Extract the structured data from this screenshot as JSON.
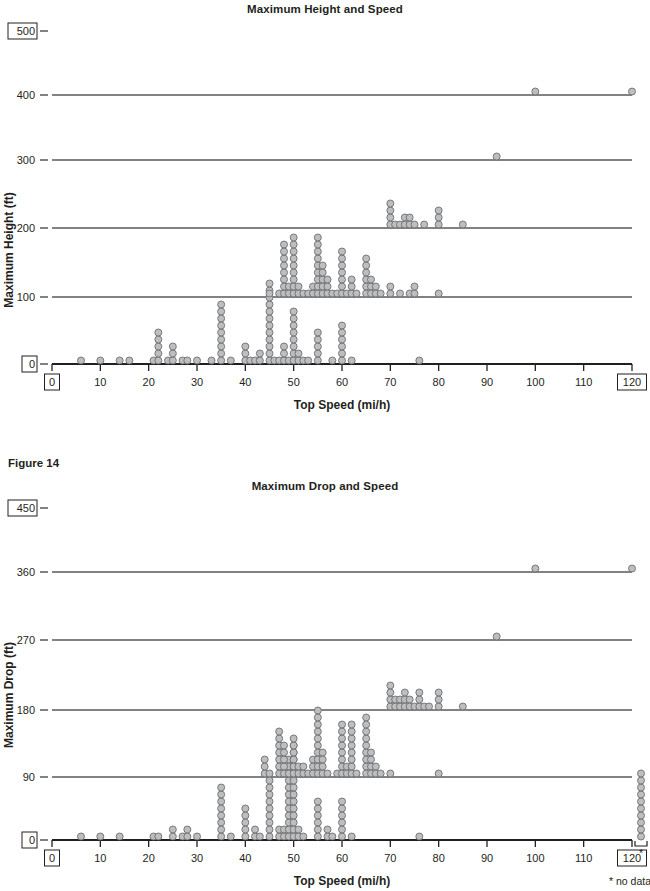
{
  "page": {
    "width": 650,
    "height": 891,
    "background": "#ffffff",
    "ink": "#231f20"
  },
  "figure_caption": "Figure 14",
  "notes": {
    "no_data": "* no data",
    "asterisk": "*"
  },
  "colors": {
    "dot_fill": "#bcbec0",
    "dot_stroke": "#6d6e71",
    "axis": "#58585b",
    "baseline": "#231f20"
  },
  "chart_data": [
    {
      "id": "max-height-and-speed",
      "type": "scatter",
      "title": "Maximum Height and Speed",
      "xlabel": "Top Speed (mi/h)",
      "ylabel": "Maximum Height (ft)",
      "xlim": [
        0,
        120
      ],
      "ylim": [
        0,
        500
      ],
      "xticks": [
        0,
        10,
        20,
        30,
        40,
        50,
        60,
        70,
        80,
        90,
        100,
        110,
        120
      ],
      "xticks_boxed": [
        0,
        120
      ],
      "yticks": [
        0,
        100,
        200,
        300,
        400,
        500
      ],
      "yticks_boxed": [
        0,
        500
      ],
      "ygridlines": [
        0,
        100,
        200,
        300,
        400
      ],
      "grid": true,
      "legend": "none",
      "stacks": [
        {
          "x": 6,
          "y": 0,
          "n": 1
        },
        {
          "x": 10,
          "y": 0,
          "n": 1
        },
        {
          "x": 14,
          "y": 0,
          "n": 1
        },
        {
          "x": 16,
          "y": 0,
          "n": 1
        },
        {
          "x": 21,
          "y": 0,
          "n": 1
        },
        {
          "x": 22,
          "y": 0,
          "n": 5
        },
        {
          "x": 24,
          "y": 0,
          "n": 1
        },
        {
          "x": 25,
          "y": 0,
          "n": 3
        },
        {
          "x": 27,
          "y": 0,
          "n": 1
        },
        {
          "x": 28,
          "y": 0,
          "n": 1
        },
        {
          "x": 30,
          "y": 0,
          "n": 1
        },
        {
          "x": 33,
          "y": 0,
          "n": 1
        },
        {
          "x": 35,
          "y": 0,
          "n": 9
        },
        {
          "x": 37,
          "y": 0,
          "n": 1
        },
        {
          "x": 40,
          "y": 0,
          "n": 3
        },
        {
          "x": 41,
          "y": 0,
          "n": 1
        },
        {
          "x": 42,
          "y": 0,
          "n": 1
        },
        {
          "x": 43,
          "y": 0,
          "n": 2
        },
        {
          "x": 45,
          "y": 0,
          "n": 12
        },
        {
          "x": 46,
          "y": 0,
          "n": 1
        },
        {
          "x": 47,
          "y": 0,
          "n": 1
        },
        {
          "x": 48,
          "y": 0,
          "n": 3
        },
        {
          "x": 49,
          "y": 0,
          "n": 1
        },
        {
          "x": 50,
          "y": 0,
          "n": 8
        },
        {
          "x": 51,
          "y": 0,
          "n": 2
        },
        {
          "x": 52,
          "y": 0,
          "n": 1
        },
        {
          "x": 53,
          "y": 0,
          "n": 1
        },
        {
          "x": 55,
          "y": 0,
          "n": 5
        },
        {
          "x": 58,
          "y": 0,
          "n": 1
        },
        {
          "x": 60,
          "y": 0,
          "n": 6
        },
        {
          "x": 62,
          "y": 0,
          "n": 1
        },
        {
          "x": 76,
          "y": 0,
          "n": 1
        },
        {
          "x": 45,
          "y": 100,
          "n": 1
        },
        {
          "x": 47,
          "y": 100,
          "n": 1
        },
        {
          "x": 48,
          "y": 100,
          "n": 8
        },
        {
          "x": 49,
          "y": 100,
          "n": 2
        },
        {
          "x": 50,
          "y": 100,
          "n": 9
        },
        {
          "x": 51,
          "y": 100,
          "n": 2
        },
        {
          "x": 52,
          "y": 100,
          "n": 1
        },
        {
          "x": 53,
          "y": 100,
          "n": 1
        },
        {
          "x": 54,
          "y": 100,
          "n": 2
        },
        {
          "x": 55,
          "y": 100,
          "n": 9
        },
        {
          "x": 56,
          "y": 100,
          "n": 5
        },
        {
          "x": 57,
          "y": 100,
          "n": 3
        },
        {
          "x": 58,
          "y": 100,
          "n": 1
        },
        {
          "x": 59,
          "y": 100,
          "n": 1
        },
        {
          "x": 60,
          "y": 100,
          "n": 7
        },
        {
          "x": 61,
          "y": 100,
          "n": 1
        },
        {
          "x": 62,
          "y": 100,
          "n": 3
        },
        {
          "x": 63,
          "y": 100,
          "n": 1
        },
        {
          "x": 65,
          "y": 100,
          "n": 6
        },
        {
          "x": 66,
          "y": 100,
          "n": 3
        },
        {
          "x": 67,
          "y": 100,
          "n": 2
        },
        {
          "x": 68,
          "y": 100,
          "n": 1
        },
        {
          "x": 70,
          "y": 100,
          "n": 2
        },
        {
          "x": 72,
          "y": 100,
          "n": 1
        },
        {
          "x": 74,
          "y": 100,
          "n": 1
        },
        {
          "x": 75,
          "y": 100,
          "n": 2
        },
        {
          "x": 80,
          "y": 100,
          "n": 1
        },
        {
          "x": 70,
          "y": 200,
          "n": 4
        },
        {
          "x": 71,
          "y": 200,
          "n": 1
        },
        {
          "x": 72,
          "y": 200,
          "n": 1
        },
        {
          "x": 73,
          "y": 200,
          "n": 2
        },
        {
          "x": 74,
          "y": 200,
          "n": 2
        },
        {
          "x": 75,
          "y": 200,
          "n": 1
        },
        {
          "x": 77,
          "y": 200,
          "n": 1
        },
        {
          "x": 80,
          "y": 200,
          "n": 3
        },
        {
          "x": 85,
          "y": 200,
          "n": 1
        },
        {
          "x": 92,
          "y": 300,
          "n": 1
        },
        {
          "x": 100,
          "y": 400,
          "n": 1
        },
        {
          "x": 120,
          "y": 400,
          "n": 1
        }
      ]
    },
    {
      "id": "max-drop-and-speed",
      "type": "scatter",
      "title": "Maximum Drop and Speed",
      "xlabel": "Top Speed (mi/h)",
      "ylabel": "Maximum Drop (ft)",
      "xlim": [
        0,
        120
      ],
      "ylim": [
        0,
        450
      ],
      "xticks": [
        0,
        10,
        20,
        30,
        40,
        50,
        60,
        70,
        80,
        90,
        100,
        110,
        120
      ],
      "xticks_boxed": [
        0,
        120
      ],
      "yticks": [
        0,
        90,
        180,
        270,
        360,
        450
      ],
      "yticks_boxed": [
        0,
        450
      ],
      "ygridlines": [
        0,
        90,
        180,
        270,
        360
      ],
      "grid": true,
      "legend": "none",
      "no_data_stack": {
        "n": 10,
        "label": "* no data"
      },
      "stacks": [
        {
          "x": 6,
          "y": 0,
          "n": 1
        },
        {
          "x": 10,
          "y": 0,
          "n": 1
        },
        {
          "x": 14,
          "y": 0,
          "n": 1
        },
        {
          "x": 21,
          "y": 0,
          "n": 1
        },
        {
          "x": 22,
          "y": 0,
          "n": 1
        },
        {
          "x": 25,
          "y": 0,
          "n": 2
        },
        {
          "x": 27,
          "y": 0,
          "n": 1
        },
        {
          "x": 28,
          "y": 0,
          "n": 2
        },
        {
          "x": 30,
          "y": 0,
          "n": 1
        },
        {
          "x": 35,
          "y": 0,
          "n": 8
        },
        {
          "x": 37,
          "y": 0,
          "n": 1
        },
        {
          "x": 40,
          "y": 0,
          "n": 5
        },
        {
          "x": 42,
          "y": 0,
          "n": 2
        },
        {
          "x": 43,
          "y": 0,
          "n": 1
        },
        {
          "x": 45,
          "y": 0,
          "n": 9
        },
        {
          "x": 47,
          "y": 0,
          "n": 2
        },
        {
          "x": 48,
          "y": 0,
          "n": 2
        },
        {
          "x": 49,
          "y": 0,
          "n": 12
        },
        {
          "x": 50,
          "y": 0,
          "n": 14
        },
        {
          "x": 51,
          "y": 0,
          "n": 2
        },
        {
          "x": 52,
          "y": 0,
          "n": 1
        },
        {
          "x": 55,
          "y": 0,
          "n": 6
        },
        {
          "x": 57,
          "y": 0,
          "n": 2
        },
        {
          "x": 58,
          "y": 0,
          "n": 1
        },
        {
          "x": 60,
          "y": 0,
          "n": 6
        },
        {
          "x": 62,
          "y": 0,
          "n": 1
        },
        {
          "x": 76,
          "y": 0,
          "n": 1
        },
        {
          "x": 44,
          "y": 90,
          "n": 3
        },
        {
          "x": 45,
          "y": 90,
          "n": 1
        },
        {
          "x": 47,
          "y": 90,
          "n": 7
        },
        {
          "x": 48,
          "y": 90,
          "n": 5
        },
        {
          "x": 49,
          "y": 90,
          "n": 1
        },
        {
          "x": 50,
          "y": 90,
          "n": 6
        },
        {
          "x": 51,
          "y": 90,
          "n": 2
        },
        {
          "x": 52,
          "y": 90,
          "n": 2
        },
        {
          "x": 53,
          "y": 90,
          "n": 1
        },
        {
          "x": 54,
          "y": 90,
          "n": 3
        },
        {
          "x": 55,
          "y": 90,
          "n": 10
        },
        {
          "x": 56,
          "y": 90,
          "n": 4
        },
        {
          "x": 57,
          "y": 90,
          "n": 1
        },
        {
          "x": 59,
          "y": 90,
          "n": 1
        },
        {
          "x": 60,
          "y": 90,
          "n": 8
        },
        {
          "x": 61,
          "y": 90,
          "n": 2
        },
        {
          "x": 62,
          "y": 90,
          "n": 8
        },
        {
          "x": 63,
          "y": 90,
          "n": 1
        },
        {
          "x": 65,
          "y": 90,
          "n": 9
        },
        {
          "x": 66,
          "y": 90,
          "n": 4
        },
        {
          "x": 67,
          "y": 90,
          "n": 2
        },
        {
          "x": 68,
          "y": 90,
          "n": 1
        },
        {
          "x": 70,
          "y": 90,
          "n": 1
        },
        {
          "x": 80,
          "y": 90,
          "n": 1
        },
        {
          "x": 70,
          "y": 180,
          "n": 4
        },
        {
          "x": 71,
          "y": 180,
          "n": 2
        },
        {
          "x": 72,
          "y": 180,
          "n": 2
        },
        {
          "x": 73,
          "y": 180,
          "n": 3
        },
        {
          "x": 74,
          "y": 180,
          "n": 2
        },
        {
          "x": 75,
          "y": 180,
          "n": 1
        },
        {
          "x": 76,
          "y": 180,
          "n": 3
        },
        {
          "x": 77,
          "y": 180,
          "n": 1
        },
        {
          "x": 78,
          "y": 180,
          "n": 1
        },
        {
          "x": 80,
          "y": 180,
          "n": 3
        },
        {
          "x": 85,
          "y": 180,
          "n": 1
        },
        {
          "x": 92,
          "y": 270,
          "n": 1
        },
        {
          "x": 100,
          "y": 360,
          "n": 1
        },
        {
          "x": 120,
          "y": 360,
          "n": 1
        }
      ]
    }
  ]
}
